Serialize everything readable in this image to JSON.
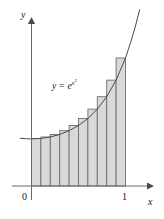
{
  "figure": {
    "name": "riemann-sum-figure",
    "curve_label_plain": "y = e^(x^2)",
    "curve_label_base": "y = e",
    "curve_label_exp_var": "x",
    "curve_label_exp_pow": "2",
    "axes": {
      "x_label": "x",
      "y_label": "y",
      "x_ticks": [
        {
          "label": "0",
          "value": 0
        },
        {
          "label": "1",
          "value": 1
        }
      ],
      "y_ticks": []
    },
    "colors": {
      "axis": "#555555",
      "curve": "#4a4a4a",
      "bar_fill": "#d9d9d9",
      "bar_stroke": "#6e6e6e",
      "text": "#1a1a1a",
      "background": "#ffffff"
    }
  },
  "chart_data": {
    "type": "area",
    "title": "",
    "subtitle": "",
    "xlabel": "x",
    "ylabel": "y",
    "function": "y = e^(x^2)",
    "annotations": [
      "y = e^(x^2)"
    ],
    "legend": [],
    "legend_position": "none",
    "grid": false,
    "xlim": [
      -0.12,
      1.18
    ],
    "ylim": [
      0,
      3.1
    ],
    "xtick_labels": [
      "0",
      "1"
    ],
    "xtick_values": [
      0,
      1
    ],
    "ytick_labels": [],
    "ytick_values": [],
    "riemann": {
      "method": "right endpoint",
      "n": 10,
      "a": 0,
      "b": 1,
      "dx": 0.1,
      "right_endpoints": [
        0.1,
        0.2,
        0.3,
        0.4,
        0.5,
        0.6,
        0.7,
        0.8,
        0.9,
        1.0
      ],
      "heights": [
        1.01,
        1.041,
        1.094,
        1.174,
        1.284,
        1.433,
        1.632,
        1.896,
        2.248,
        2.718
      ]
    },
    "curve_points": {
      "x": [
        -0.12,
        -0.05,
        0.0,
        0.1,
        0.2,
        0.3,
        0.4,
        0.5,
        0.6,
        0.7,
        0.8,
        0.9,
        1.0,
        1.05,
        1.1,
        1.15
      ],
      "y": [
        1.014,
        1.003,
        1.0,
        1.01,
        1.041,
        1.094,
        1.174,
        1.284,
        1.433,
        1.632,
        1.896,
        2.248,
        2.718,
        3.02,
        3.35,
        3.74
      ]
    }
  }
}
